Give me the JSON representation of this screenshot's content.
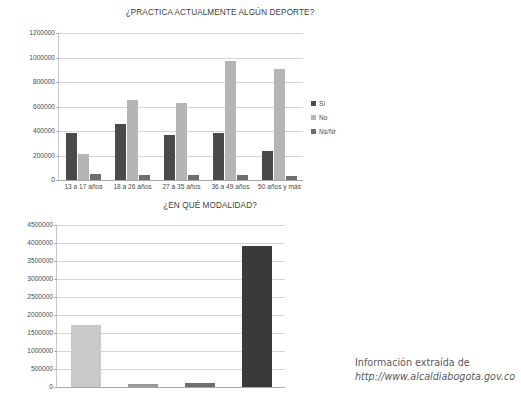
{
  "attribution": {
    "line1": "Información extraída de",
    "line2": "http://www.alcaldiabogota.gov.co"
  },
  "colors": {
    "series_dark": "#4a4a4a",
    "series_light": "#b5b5b5",
    "series_mid": "#6e6e6e",
    "series_pale": "#c9c9c9",
    "series_black": "#3a3a3a",
    "grid": "#d4d4d4",
    "axis": "#a6a6a6",
    "text": "#4a4a4a"
  },
  "chart_data": [
    {
      "id": "practica-deporte",
      "type": "bar",
      "title": "¿PRACTICA ACTUALMENTE ALGÚN DEPORTE?",
      "xlabel": "",
      "ylabel": "",
      "ylim": [
        0,
        1200000
      ],
      "ytick_step": 200000,
      "yticks": [
        "0",
        "200000",
        "400000",
        "600000",
        "800000",
        "1000000",
        "1200000"
      ],
      "grid": true,
      "legend_position": "right",
      "categories": [
        "13 a 17 años",
        "18 a 26 años",
        "27 a 35 años",
        "36 a 49 años",
        "50 años y más"
      ],
      "series": [
        {
          "name": "Sí",
          "color": "#4a4a4a",
          "values": [
            380000,
            455000,
            365000,
            380000,
            240000
          ]
        },
        {
          "name": "No",
          "color": "#b5b5b5",
          "values": [
            215000,
            655000,
            630000,
            970000,
            910000
          ]
        },
        {
          "name": "Ns/Nr",
          "color": "#6e6e6e",
          "values": [
            48000,
            45000,
            42000,
            38000,
            35000
          ]
        }
      ]
    },
    {
      "id": "modalidad",
      "type": "bar",
      "title": "¿EN QUÉ MODALIDAD?",
      "xlabel": "",
      "ylabel": "",
      "ylim": [
        0,
        4500000
      ],
      "ytick_step": 500000,
      "yticks": [
        "0",
        "500000",
        "1000000",
        "1500000",
        "2000000",
        "2500000",
        "3000000",
        "3500000",
        "4000000",
        "4500000"
      ],
      "grid": true,
      "legend_position": "right",
      "categories": [
        "Aficionado",
        "Profesional",
        "Ns/Nr",
        "N/A"
      ],
      "series": [
        {
          "name": "Aficionado",
          "color": "#c9c9c9",
          "values": [
            1730000
          ]
        },
        {
          "name": "Profesional",
          "color": "#9a9a9a",
          "values": [
            70000
          ]
        },
        {
          "name": "Ns/Nr",
          "color": "#6e6e6e",
          "values": [
            110000
          ]
        },
        {
          "name": "N/A",
          "color": "#3a3a3a",
          "values": [
            3915000
          ]
        }
      ]
    }
  ]
}
